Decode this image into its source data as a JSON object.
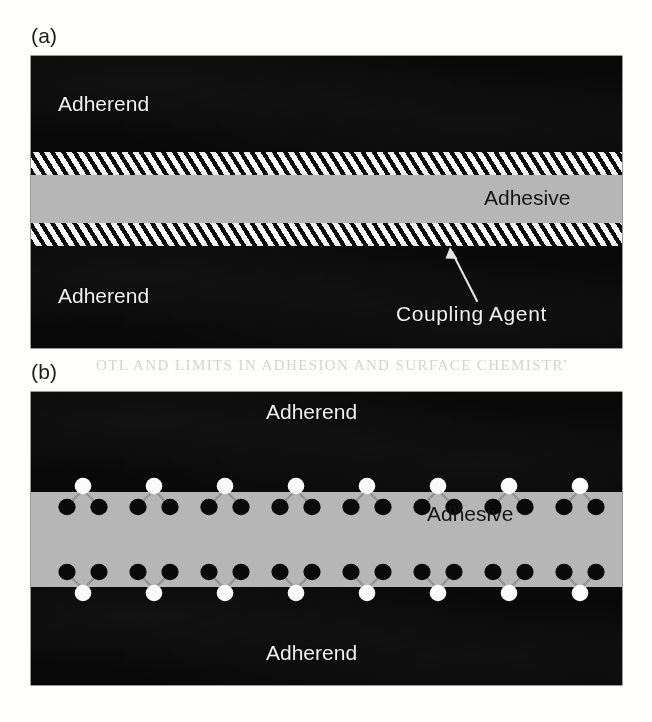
{
  "figure": {
    "panels": [
      {
        "key": "a",
        "label": "(a)",
        "labels": {
          "adherend_top": "Adherend",
          "adherend_bottom": "Adherend",
          "adhesive": "Adhesive",
          "coupling_agent": "Coupling Agent"
        },
        "layers": [
          {
            "name": "adherend-top",
            "fill": "#090909",
            "kind": "solid-dark"
          },
          {
            "name": "coupling-agent-upper",
            "fill": "#ffffff",
            "kind": "hatched"
          },
          {
            "name": "adhesive",
            "fill": "#b9b9b9",
            "kind": "solid-grey"
          },
          {
            "name": "coupling-agent-lower",
            "fill": "#ffffff",
            "kind": "hatched"
          },
          {
            "name": "adherend-bottom",
            "fill": "#090909",
            "kind": "solid-dark"
          }
        ],
        "annotation": {
          "arrow_target": "coupling-agent-lower",
          "arrow_color": "#e8e8e8"
        }
      },
      {
        "key": "b",
        "label": "(b)",
        "labels": {
          "adherend_top": "Adherend",
          "adherend_bottom": "Adherend",
          "adhesive": "Adhesive"
        },
        "layers": [
          {
            "name": "adherend-top",
            "fill": "#090909",
            "kind": "solid-dark"
          },
          {
            "name": "adhesive",
            "fill": "#b9b9b9",
            "kind": "solid-grey"
          },
          {
            "name": "adherend-bottom",
            "fill": "#090909",
            "kind": "solid-dark"
          }
        ],
        "molecular": {
          "white_node_count_per_interface": 8,
          "black_node_count_per_interface": 16,
          "white_node_color": "#fdfdfd",
          "black_node_color": "#0a0a0a",
          "bond_color": "#8f8f8f",
          "description": "Coupling-agent molecules: one white anchor atom in the adherend bonded by two links to a pair of black atoms in the adhesive"
        }
      }
    ]
  },
  "colors": {
    "adherend": "#090909",
    "adhesive": "#b9b9b9",
    "coupling_agent_hatch_light": "#fdfdfd",
    "coupling_agent_hatch_dark": "#0d0d0d",
    "page_background": "#fefefd",
    "label_light": "#f2f2f2",
    "label_dark": "#141414"
  },
  "ghost": {
    "bleed_text": "OTL AND LIMITS IN  ADHESION  AND SURFACE CHEMISTRY"
  }
}
